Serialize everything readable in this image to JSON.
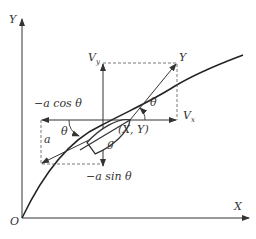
{
  "diagram": {
    "axes": {
      "x_label": "X",
      "y_label": "Y",
      "origin_label": "O"
    },
    "labels": {
      "position": "(X, Y)",
      "velocity_total": "Y",
      "velocity_y": "V",
      "velocity_y_sub": "y",
      "velocity_x": "V",
      "velocity_x_sub": "x",
      "theta_upper": "θ",
      "theta_lower": "θ",
      "gravity": "g",
      "acceleration": "a",
      "a_cos": "−a cos θ",
      "a_sin": "−a sin θ"
    },
    "colors": {
      "line": "#333333",
      "curve": "#222222",
      "background": "#ffffff"
    }
  }
}
